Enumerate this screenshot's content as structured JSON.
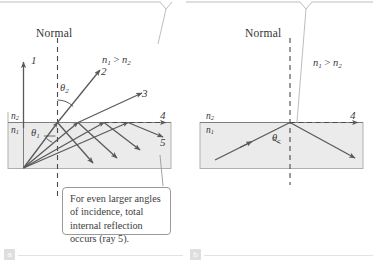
{
  "figure": {
    "panels": [
      {
        "id": "a",
        "tag": "a",
        "normal_label": "Normal",
        "index_upper": "n",
        "index_upper_sub": "2",
        "index_lower": "n",
        "index_lower_sub": "1",
        "inequality": "n₁ > n₂",
        "inequality_lead": "n",
        "inequality_lead_sub": "1",
        "inequality_mid": " > ",
        "inequality_tail": "n",
        "inequality_tail_sub": "2",
        "angle_refracted": "θ",
        "angle_refracted_sub": "2",
        "angle_incident": "θ",
        "angle_incident_sub": "1",
        "ray_labels": [
          "1",
          "2",
          "3",
          "4",
          "5"
        ],
        "callout": "For even larger angles of incidence, total internal reflection occurs (ray 5)."
      },
      {
        "id": "b",
        "tag": "b",
        "normal_label": "Normal",
        "index_upper": "n",
        "index_upper_sub": "2",
        "index_lower": "n",
        "index_lower_sub": "1",
        "inequality_lead": "n",
        "inequality_lead_sub": "1",
        "inequality_mid": " > ",
        "inequality_tail": "n",
        "inequality_tail_sub": "2",
        "angle_critical": "θ",
        "angle_critical_sub": "c",
        "ray_labels": [
          "4"
        ]
      }
    ],
    "colors": {
      "ray": "#5a5a5a",
      "slab_fill": "#ebebeb",
      "slab_border": "#a8a8a8",
      "callout_border": "#9a9a9a",
      "text": "#3a3a3a",
      "rule": "#e2e2e2",
      "tag_bg": "#d9d9d9"
    }
  }
}
